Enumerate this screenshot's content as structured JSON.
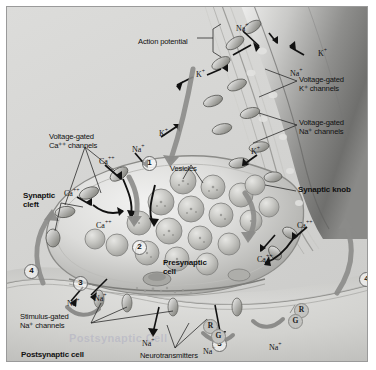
{
  "figure": {
    "title_visible": false,
    "background_color": "#d8d8d6",
    "border_color": "#9a9a9a",
    "style": "grayscale airbrushed biological illustration of a chemical synapse"
  },
  "labels": [
    {
      "id": "action-potential",
      "text": "Action potential",
      "bold": false,
      "x": 131,
      "y": 31,
      "size": 7.6
    },
    {
      "id": "voltage-gated-k-channels",
      "text": "Voltage-gated\nK⁺ channels",
      "bold": false,
      "x": 292,
      "y": 69,
      "size": 7.6
    },
    {
      "id": "voltage-gated-na-channels",
      "text": "Voltage-gated\nNa⁺ channels",
      "bold": false,
      "x": 292,
      "y": 112,
      "size": 7.6
    },
    {
      "id": "voltage-gated-ca-channels",
      "text": "Voltage-gated\nCa⁺⁺ channels",
      "bold": false,
      "x": 42,
      "y": 126,
      "size": 7.6
    },
    {
      "id": "vesicles",
      "text": "Vesicles",
      "bold": false,
      "x": 163,
      "y": 158,
      "size": 7.6
    },
    {
      "id": "synaptic-cleft",
      "text": "Synaptic\ncleft",
      "bold": true,
      "x": 16,
      "y": 185,
      "size": 8.0
    },
    {
      "id": "synaptic-knob",
      "text": "Synaptic knob",
      "bold": true,
      "x": 291,
      "y": 179,
      "size": 8.0
    },
    {
      "id": "presynaptic-cell",
      "text": "Presynaptic\ncell",
      "bold": true,
      "x": 156,
      "y": 252,
      "size": 8.0
    },
    {
      "id": "stimulus-gated-na-channels",
      "text": "Stimulus-gated\nNa⁺ channels",
      "bold": false,
      "x": 13,
      "y": 306,
      "size": 7.6
    },
    {
      "id": "postsynaptic-cell",
      "text": "Postsynaptic cell",
      "bold": true,
      "x": 14,
      "y": 344,
      "size": 8.0
    },
    {
      "id": "neurotransmitters",
      "text": "Neurotransmitters",
      "bold": false,
      "x": 133,
      "y": 345,
      "size": 7.6
    }
  ],
  "watermark": {
    "text": "Postsynaptic Cell",
    "x": 62,
    "y": 325
  },
  "ions": [
    {
      "id": "ion-na-1",
      "text": "Na",
      "charge": "+",
      "x": 229,
      "y": 15,
      "size": 8
    },
    {
      "id": "ion-k-1",
      "text": "K",
      "charge": "+",
      "x": 311,
      "y": 40,
      "size": 8
    },
    {
      "id": "ion-na-2",
      "text": "Na",
      "charge": "+",
      "x": 283,
      "y": 60,
      "size": 8
    },
    {
      "id": "ion-k-2",
      "text": "K",
      "charge": "+",
      "x": 189,
      "y": 61,
      "size": 8
    },
    {
      "id": "ion-k-3",
      "text": "K",
      "charge": "+",
      "x": 152,
      "y": 120,
      "size": 8
    },
    {
      "id": "ion-na-3",
      "text": "Na",
      "charge": "+",
      "x": 125,
      "y": 136,
      "size": 8
    },
    {
      "id": "ion-k-4",
      "text": "K",
      "charge": "+",
      "x": 244,
      "y": 138,
      "size": 8
    },
    {
      "id": "ion-ca-1",
      "text": "Ca",
      "charge": "++",
      "x": 92,
      "y": 148,
      "size": 8
    },
    {
      "id": "ion-ca-2",
      "text": "Ca",
      "charge": "++",
      "x": 57,
      "y": 180,
      "size": 8
    },
    {
      "id": "ion-ca-3",
      "text": "Ca",
      "charge": "++",
      "x": 89,
      "y": 212,
      "size": 8
    },
    {
      "id": "ion-ca-4",
      "text": "Ca",
      "charge": "++",
      "x": 290,
      "y": 212,
      "size": 8
    },
    {
      "id": "ion-ca-5",
      "text": "Ca",
      "charge": "++",
      "x": 250,
      "y": 246,
      "size": 8
    },
    {
      "id": "ion-na-4",
      "text": "Na",
      "charge": "+",
      "x": 87,
      "y": 285,
      "size": 8
    },
    {
      "id": "ion-na-5",
      "text": "Na",
      "charge": "+",
      "x": 60,
      "y": 290,
      "size": 8
    },
    {
      "id": "ion-na-6",
      "text": "Na",
      "charge": "+",
      "x": 135,
      "y": 330,
      "size": 8
    },
    {
      "id": "ion-na-7",
      "text": "Na",
      "charge": "+",
      "x": 196,
      "y": 338,
      "size": 8
    },
    {
      "id": "ion-na-8",
      "text": "Na",
      "charge": "+",
      "x": 262,
      "y": 334,
      "size": 8
    }
  ],
  "step_markers": [
    {
      "id": "step-1",
      "number": "1",
      "x": 135,
      "y": 149
    },
    {
      "id": "step-2",
      "number": "2",
      "x": 125,
      "y": 233
    },
    {
      "id": "step-3-left",
      "number": "3",
      "x": 66,
      "y": 269
    },
    {
      "id": "step-3-right",
      "number": "3",
      "x": 205,
      "y": 330
    },
    {
      "id": "step-4-left",
      "number": "4",
      "x": 17,
      "y": 257
    },
    {
      "id": "step-4-right",
      "number": "4",
      "x": 352,
      "y": 265
    }
  ],
  "receptors": [
    {
      "id": "receptor-r-left",
      "letter": "R",
      "x": 196,
      "y": 312
    },
    {
      "id": "receptor-g-left",
      "letter": "G",
      "x": 204,
      "y": 322
    },
    {
      "id": "receptor-r-right",
      "letter": "R",
      "x": 287,
      "y": 296
    },
    {
      "id": "receptor-g-right",
      "letter": "G",
      "x": 281,
      "y": 307
    }
  ],
  "legend_note": {
    "steps_meaning": [
      "1 — action potential arrives, voltage-gated Ca++ channels open",
      "2 — vesicles move to and fuse with presynaptic membrane",
      "3 — neurotransmitter binds receptors, stimulus-gated Na+ channels open",
      "4 — postsynaptic potential spreads away from synapse"
    ]
  }
}
